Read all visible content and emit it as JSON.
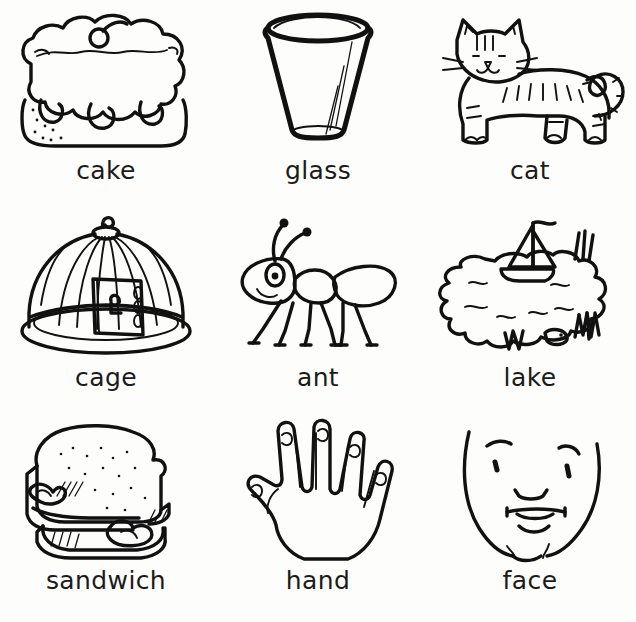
{
  "page": {
    "background_color": "#fdfdfc",
    "ink_color": "#111111",
    "columns": 3,
    "rows": 3
  },
  "cards": [
    {
      "id": "cake",
      "label": "cake",
      "icon": "cake-illustration",
      "row": 1,
      "column": 1
    },
    {
      "id": "glass",
      "label": "glass",
      "icon": "glass-illustration",
      "row": 1,
      "column": 2
    },
    {
      "id": "cat",
      "label": "cat",
      "icon": "cat-illustration",
      "row": 1,
      "column": 3
    },
    {
      "id": "cage",
      "label": "cage",
      "icon": "cage-illustration",
      "row": 2,
      "column": 1
    },
    {
      "id": "ant",
      "label": "ant",
      "icon": "ant-illustration",
      "row": 2,
      "column": 2
    },
    {
      "id": "lake",
      "label": "lake",
      "icon": "lake-illustration",
      "row": 2,
      "column": 3
    },
    {
      "id": "sandwich",
      "label": "sandwich",
      "icon": "sandwich-illustration",
      "row": 3,
      "column": 1
    },
    {
      "id": "hand",
      "label": "hand",
      "icon": "hand-illustration",
      "row": 3,
      "column": 2
    },
    {
      "id": "face",
      "label": "face",
      "icon": "face-illustration",
      "row": 3,
      "column": 3
    }
  ]
}
